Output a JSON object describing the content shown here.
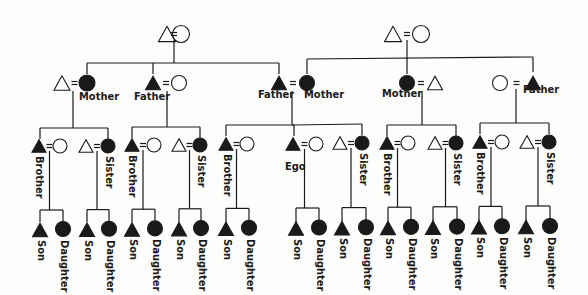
{
  "diagram": {
    "colors": {
      "ink": "#1a1a1a",
      "paper": "#fdfdfc"
    },
    "legend_notation": {
      "triangle": "male",
      "circle": "female",
      "equals": "marriage",
      "filled": "consanguineal kin"
    },
    "generations": [
      {
        "level": "grandparents",
        "couples": [
          {
            "id": "gp_left",
            "members": [
              "male-open",
              "female-open"
            ]
          },
          {
            "id": "gp_right",
            "members": [
              "male-open",
              "female-open"
            ]
          }
        ]
      },
      {
        "level": "parents",
        "couples": [
          {
            "id": "p1",
            "label": "Mother",
            "members": [
              "male-open",
              "female-filled"
            ]
          },
          {
            "id": "p2",
            "label": "Father",
            "members": [
              "male-filled",
              "female-open"
            ]
          },
          {
            "id": "p3",
            "label_left": "Father",
            "label_right": "Mother",
            "members": [
              "male-filled",
              "female-filled"
            ]
          },
          {
            "id": "p4",
            "label": "Mother",
            "members": [
              "female-filled",
              "male-open"
            ]
          },
          {
            "id": "p5",
            "label": "Father",
            "members": [
              "female-open",
              "male-filled"
            ]
          }
        ]
      }
    ],
    "labels": {
      "mother": "Mother",
      "father": "Father",
      "brother": "Brother",
      "sister": "Sister",
      "ego": "Ego",
      "son": "Son",
      "daughter": "Daughter"
    },
    "sibling_row": [
      "Brother",
      "Sister",
      "Brother",
      "Sister",
      "Brother",
      "Ego",
      "Sister",
      "Brother",
      "Sister",
      "Brother",
      "Sister"
    ],
    "child_row_pairs": 11,
    "child_row": [
      "Son",
      "Daughter"
    ]
  }
}
